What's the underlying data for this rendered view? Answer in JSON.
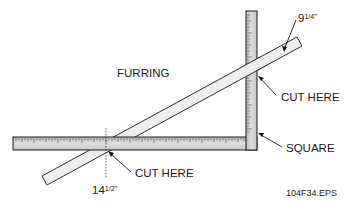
{
  "diagram": {
    "title_label": "FURRING",
    "labels": {
      "top_measure_whole": "9",
      "top_measure_fraction": "1/4",
      "top_measure_unit": "\"",
      "cut_here_upper": "CUT HERE",
      "square": "SQUARE",
      "cut_here_lower": "CUT HERE",
      "bottom_measure_whole": "14",
      "bottom_measure_fraction": "1/2",
      "bottom_measure_unit": "\"",
      "file_name": "104F34.EPS"
    },
    "colors": {
      "outline": "#1a1a1a",
      "square_fill": "#cfcfcf",
      "furring_fill": "#eeeeee",
      "background": "#ffffff"
    }
  }
}
